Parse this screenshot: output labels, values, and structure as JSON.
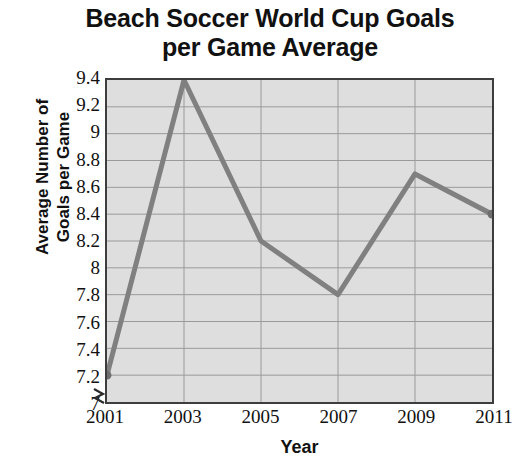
{
  "chart_data": {
    "type": "line",
    "title": "Beach Soccer World Cup Goals per Game Average",
    "title_lines": [
      "Beach Soccer World Cup Goals",
      "per Game Average"
    ],
    "xlabel": "Year",
    "ylabel": "Average Number of Goals per Game",
    "ylabel_lines": [
      "Average Number of",
      "Goals per Game"
    ],
    "categories": [
      "2001",
      "2003",
      "2005",
      "2007",
      "2009",
      "2011"
    ],
    "x": [
      2001,
      2003,
      2005,
      2007,
      2009,
      2011
    ],
    "values": [
      7.2,
      9.4,
      8.2,
      7.8,
      8.7,
      8.4
    ],
    "series": [
      {
        "name": "Average Number of Goals per Game",
        "values": [
          7.2,
          9.4,
          8.2,
          7.8,
          8.7,
          8.4
        ]
      }
    ],
    "ylim": [
      7,
      9.4
    ],
    "xlim": [
      2001,
      2011
    ],
    "ytick_labels": [
      "9.4",
      "9.2",
      "9",
      "8.8",
      "8.6",
      "8.4",
      "8.2",
      "8",
      "7.8",
      "7.6",
      "7.4",
      "7.2",
      "7"
    ],
    "ytick_values": [
      9.4,
      9.2,
      9.0,
      8.8,
      8.6,
      8.4,
      8.2,
      8.0,
      7.8,
      7.6,
      7.4,
      7.2,
      7.0
    ],
    "ytick_step": 0.2,
    "xtick_labels": [
      "2001",
      "2003",
      "2005",
      "2007",
      "2009",
      "2011"
    ],
    "grid": true,
    "grid_horizontal": true,
    "grid_vertical": true,
    "legend": false,
    "axis_break": true,
    "markers": true,
    "colors": {
      "line": "#808080",
      "marker": "#6e6e6e",
      "plot_background": "#dedede",
      "plot_border": "#3d3d3d",
      "gridline": "#9a9a9a",
      "text": "#111111",
      "page_background": "#ffffff"
    }
  }
}
